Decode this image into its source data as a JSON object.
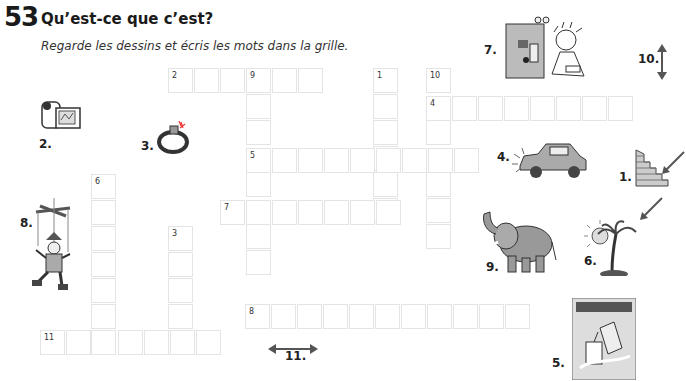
{
  "exercise": {
    "number": "53",
    "title": "Qu’est-ce que c’est?",
    "instruction": "Regarde les dessins et écris les mots dans la grille."
  },
  "grid": {
    "cell_size": 26,
    "words": [
      {
        "clue": "1",
        "direction": "down",
        "x": 373,
        "y": 68,
        "length": 6
      },
      {
        "clue": "2",
        "direction": "across",
        "x": 168,
        "y": 68,
        "length": 6
      },
      {
        "clue": "3",
        "direction": "down",
        "x": 168,
        "y": 226,
        "length": 5
      },
      {
        "clue": "4",
        "direction": "across",
        "x": 426,
        "y": 96,
        "length": 8
      },
      {
        "clue": "5",
        "direction": "across",
        "x": 246,
        "y": 148,
        "length": 9
      },
      {
        "clue": "6",
        "direction": "down",
        "x": 91,
        "y": 174,
        "length": 7
      },
      {
        "clue": "7",
        "direction": "across",
        "x": 220,
        "y": 200,
        "length": 7
      },
      {
        "clue": "8",
        "direction": "across",
        "x": 245,
        "y": 304,
        "length": 11
      },
      {
        "clue": "9",
        "direction": "down",
        "x": 246,
        "y": 68,
        "length": 8
      },
      {
        "clue": "10",
        "direction": "down",
        "x": 426,
        "y": 68,
        "length": 7
      },
      {
        "clue": "11",
        "direction": "across",
        "x": 40,
        "y": 330,
        "length": 7
      }
    ]
  },
  "pictures": [
    {
      "label": "1.",
      "icon": "staircase-icon",
      "hint_arrow": "arrow pointing to steps"
    },
    {
      "label": "2.",
      "icon": "camcorder-icon"
    },
    {
      "label": "3.",
      "icon": "diamond-ring-icon"
    },
    {
      "label": "4.",
      "icon": "crashed-car-icon"
    },
    {
      "label": "5.",
      "icon": "soda-poster-icon"
    },
    {
      "label": "6.",
      "icon": "palm-tree-island-icon",
      "hint_arrow": "arrow pointing to island"
    },
    {
      "label": "7.",
      "icon": "inventor-machine-icon"
    },
    {
      "label": "8.",
      "icon": "marionette-icon"
    },
    {
      "label": "9.",
      "icon": "elephant-icon"
    },
    {
      "label": "10.",
      "icon": "vertical-double-arrow-icon"
    },
    {
      "label": "11.",
      "icon": "horizontal-double-arrow-icon"
    }
  ]
}
